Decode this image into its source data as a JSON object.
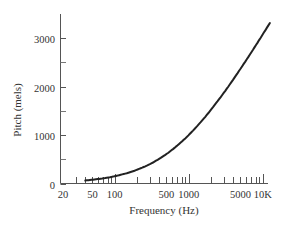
{
  "chart_data": {
    "type": "line",
    "title": "",
    "xlabel": "Frequency (Hz)",
    "ylabel": "Pitch (mels)",
    "x_scale": "log",
    "xlim": [
      20,
      12500
    ],
    "ylim": [
      0,
      3500
    ],
    "x_tick_labels": [
      "20",
      "50",
      "100",
      "500",
      "1000",
      "5000",
      "10K"
    ],
    "x_tick_values": [
      20,
      50,
      100,
      500,
      1000,
      5000,
      10000
    ],
    "x_minor_ticks": [
      30,
      40,
      60,
      70,
      80,
      90,
      200,
      300,
      400,
      600,
      700,
      800,
      900,
      2000,
      3000,
      4000,
      6000,
      7000,
      8000,
      9000
    ],
    "y_tick_labels": [
      "0",
      "1000",
      "2000",
      "3000"
    ],
    "y_tick_values": [
      0,
      1000,
      2000,
      3000
    ],
    "y_minor_ticks": [
      500,
      1500,
      2500
    ],
    "grid": false,
    "legend": null,
    "series": [
      {
        "name": "Mel scale",
        "x": [
          40,
          60,
          100,
          200,
          300,
          500,
          700,
          1000,
          1500,
          2000,
          3000,
          4000,
          5000,
          7000,
          10000,
          12500
        ],
        "values": [
          64,
          94,
          150,
          283,
          402,
          607,
          781,
          1000,
          1329,
          1521,
          1876,
          2146,
          2363,
          2704,
          3073,
          3300
        ]
      }
    ]
  }
}
